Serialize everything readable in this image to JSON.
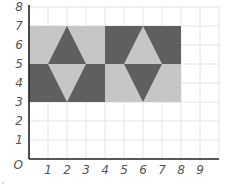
{
  "figure": {
    "type": "coordinate-grid-pattern",
    "x_axis": {
      "ticks": [
        "0",
        "1",
        "2",
        "3",
        "4",
        "5",
        "6",
        "7",
        "8",
        "9"
      ],
      "range": [
        0,
        10
      ]
    },
    "y_axis": {
      "ticks": [
        "1",
        "2",
        "3",
        "4",
        "5",
        "6",
        "7",
        "8"
      ],
      "range": [
        0,
        8
      ]
    },
    "origin_label": "O",
    "colors": {
      "light": "#c6c6c6",
      "dark": "#5f5f5f",
      "grid": "#e4e4e4",
      "axis": "#222222"
    },
    "shapes": [
      {
        "name": "left-top-light-rect",
        "fill": "light",
        "points": [
          [
            0,
            5
          ],
          [
            4,
            5
          ],
          [
            4,
            7
          ],
          [
            0,
            7
          ]
        ]
      },
      {
        "name": "left-top-dark-triangle",
        "fill": "dark",
        "points": [
          [
            1,
            5
          ],
          [
            3,
            5
          ],
          [
            2,
            7
          ]
        ]
      },
      {
        "name": "left-bottom-dark-rect",
        "fill": "dark",
        "points": [
          [
            0,
            3
          ],
          [
            4,
            3
          ],
          [
            4,
            5
          ],
          [
            0,
            5
          ]
        ]
      },
      {
        "name": "left-bottom-light-triangle",
        "fill": "light",
        "points": [
          [
            1,
            5
          ],
          [
            3,
            5
          ],
          [
            2,
            3
          ]
        ]
      },
      {
        "name": "right-top-dark-rect",
        "fill": "dark",
        "points": [
          [
            4,
            5
          ],
          [
            8,
            5
          ],
          [
            8,
            7
          ],
          [
            4,
            7
          ]
        ]
      },
      {
        "name": "right-top-light-triangle",
        "fill": "light",
        "points": [
          [
            5,
            5
          ],
          [
            7,
            5
          ],
          [
            6,
            7
          ]
        ]
      },
      {
        "name": "right-bottom-light-rect",
        "fill": "light",
        "points": [
          [
            4,
            3
          ],
          [
            8,
            3
          ],
          [
            8,
            5
          ],
          [
            4,
            5
          ]
        ]
      },
      {
        "name": "right-bottom-dark-triangle",
        "fill": "dark",
        "points": [
          [
            5,
            5
          ],
          [
            7,
            5
          ],
          [
            6,
            3
          ]
        ]
      }
    ]
  }
}
